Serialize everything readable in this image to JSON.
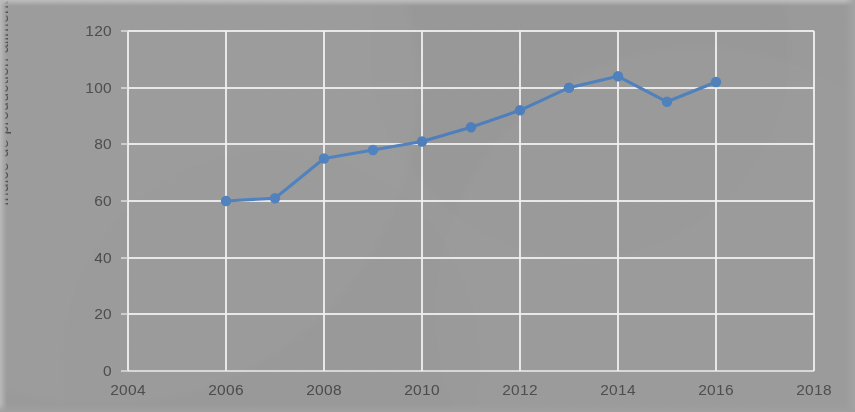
{
  "chart_data": {
    "type": "line",
    "title": "",
    "subtitle": "",
    "xlabel": "",
    "ylabel": "Indice de production alimentaire",
    "xlim": [
      2004,
      2018
    ],
    "ylim": [
      0,
      120
    ],
    "xticks": [
      2004,
      2006,
      2008,
      2010,
      2012,
      2014,
      2016,
      2018
    ],
    "yticks": [
      0,
      20,
      40,
      60,
      80,
      100,
      120
    ],
    "grid": true,
    "legend": false,
    "legend_position": "none",
    "marker": "circle",
    "series_color": "#4f81bd",
    "x": [
      2006,
      2007,
      2008,
      2009,
      2010,
      2011,
      2012,
      2013,
      2014,
      2015,
      2016
    ],
    "values": [
      60,
      61,
      75,
      78,
      81,
      86,
      92,
      100,
      104,
      95,
      102
    ],
    "series": [
      {
        "name": "Indice de production alimentaire",
        "x": [
          2006,
          2007,
          2008,
          2009,
          2010,
          2011,
          2012,
          2013,
          2014,
          2015,
          2016
        ],
        "values": [
          60,
          61,
          75,
          78,
          81,
          86,
          92,
          100,
          104,
          95,
          102
        ]
      }
    ],
    "annotations": []
  },
  "colors": {
    "background": "#9a9a9a",
    "gridline": "#efefef",
    "tick_text": "#4c4c4c",
    "series": "#4f81bd"
  }
}
